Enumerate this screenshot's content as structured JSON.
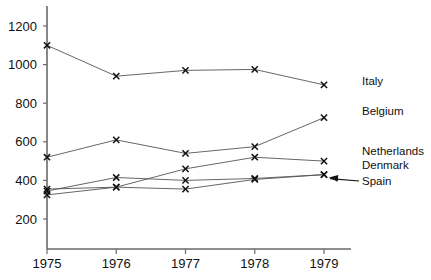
{
  "chart_data": {
    "type": "line",
    "title": "",
    "subtitle": "",
    "xlabel": "",
    "ylabel": "",
    "categories": [
      "1975",
      "1976",
      "1977",
      "1978",
      "1979"
    ],
    "x": [
      1975,
      1976,
      1977,
      1978,
      1979
    ],
    "xlim": [
      1975,
      1979
    ],
    "ylim": [
      0,
      1280
    ],
    "yticks": [
      200,
      400,
      600,
      800,
      1000,
      1200
    ],
    "ytick_labels": [
      "200",
      "400",
      "600",
      "800",
      "1000",
      "1200"
    ],
    "xtick_labels": [
      "1975",
      "1976",
      "1977",
      "1978",
      "1979"
    ],
    "grid": false,
    "legend_position": "right-inline-labels",
    "marker": "x",
    "series": [
      {
        "name": "Italy",
        "values": [
          1100,
          940,
          970,
          975,
          895
        ]
      },
      {
        "name": "Belgium",
        "values": [
          520,
          610,
          540,
          575,
          725
        ]
      },
      {
        "name": "Netherlands",
        "values": [
          355,
          365,
          460,
          520,
          500
        ]
      },
      {
        "name": "Denmark",
        "values": [
          345,
          415,
          400,
          410,
          430
        ]
      },
      {
        "name": "Spain",
        "values": [
          325,
          365,
          355,
          405,
          430
        ]
      }
    ],
    "annotations": [
      {
        "text": "Spain",
        "kind": "arrow-to-point",
        "target_x": 1979,
        "target_y": 430
      }
    ]
  },
  "labels": {
    "italy": "Italy",
    "belgium": "Belgium",
    "netherlands": "Netherlands",
    "denmark": "Denmark",
    "spain": "Spain"
  },
  "colors": {
    "axis": "#6a6a6a",
    "line": "#555555",
    "marker": "#111111",
    "text": "#111111",
    "background": "#ffffff"
  }
}
